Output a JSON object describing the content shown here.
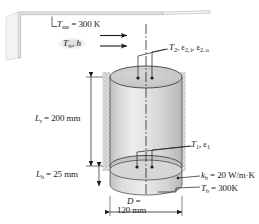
{
  "figure": {
    "kind": "heat-transfer-schematic"
  },
  "labels": {
    "surroundings": {
      "symbol": "T",
      "sub": "sur",
      "text": " = 300 K",
      "full": "T_sur = 300 K"
    },
    "ambient": {
      "symbol": "T",
      "sub": "∞",
      "text": ", h",
      "full": "T_inf, h"
    },
    "top_surface": {
      "full": "T_2, ε_2,i, ε_2,o"
    },
    "inner_surface": {
      "full": "T_1, ε_1"
    },
    "height": {
      "symbol": "L",
      "sub": "r",
      "text": " = 200 mm",
      "full": "L_r = 200 mm"
    },
    "base_thickness": {
      "symbol": "L",
      "sub": "b",
      "text": " = 25 mm",
      "full": "L_b = 25 mm"
    },
    "base_conductivity": {
      "symbol": "k",
      "sub": "b",
      "text": " = 20 W/m·K",
      "full": "k_b = 20 W/m·K"
    },
    "base_temperature": {
      "symbol": "T",
      "sub": "b",
      "text": " = 300K",
      "full": "T_b = 300K"
    },
    "diameter_line1": {
      "symbol": "D",
      "text": " =",
      "full": "D ="
    },
    "diameter_line2": {
      "text": "120 mm",
      "full": "120 mm"
    }
  },
  "values": {
    "T_sur_K": 300,
    "L_r_mm": 200,
    "L_b_mm": 25,
    "D_mm": 120,
    "k_b_W_per_mK": 20,
    "T_b_K": 300
  },
  "colors": {
    "ink": "#1a1a1a",
    "cylinder_light": "#ececed",
    "cylinder_mid": "#d9d9da",
    "cylinder_dark": "#bfbfc1",
    "top_disk": "#c9c9cb",
    "insulation": "#d2d2d4",
    "wall": "#e8e8e8"
  },
  "icons": {
    "flow_arrow": "arrow-right-icon",
    "leader": "leader-line-icon",
    "dimension": "dimension-arrow-icon",
    "centerline": "centerline-icon"
  }
}
